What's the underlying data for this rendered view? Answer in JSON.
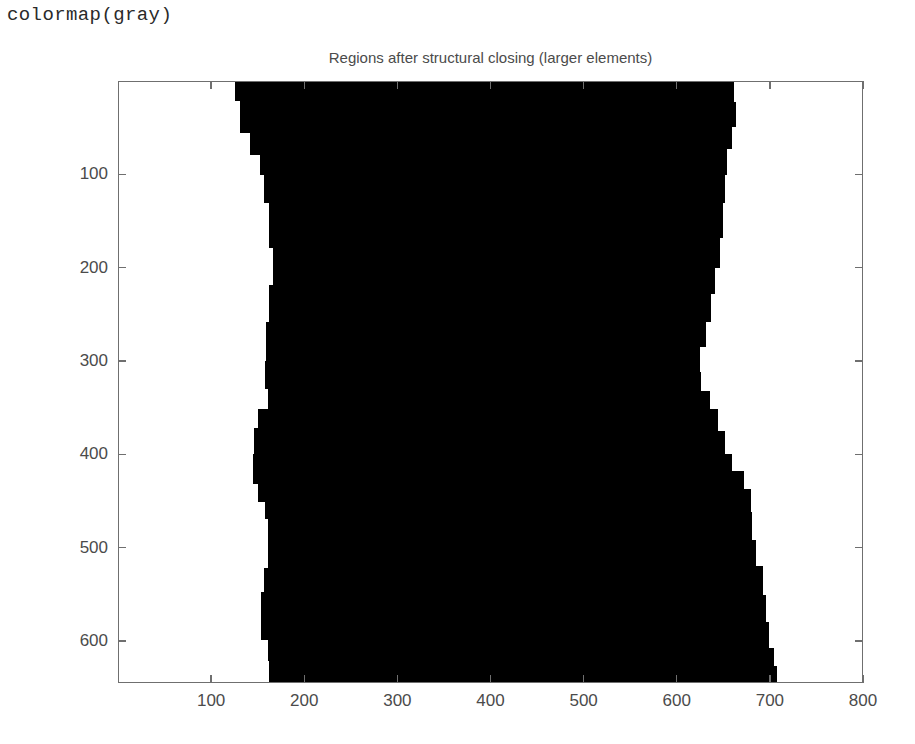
{
  "caption": {
    "code_text": "colormap(gray)"
  },
  "figure": {
    "title": "Regions after structural closing (larger elements)",
    "background_color": "#ffffff",
    "foreground_color": "#000000",
    "axis_color": "#6f6f6f",
    "text_color": "#4b4b4b",
    "xaxis": {
      "ticks": [
        100,
        200,
        300,
        400,
        500,
        600,
        700,
        800
      ],
      "ticklabels": [
        "100",
        "200",
        "300",
        "400",
        "500",
        "600",
        "700",
        "800"
      ],
      "range": [
        0,
        800
      ],
      "label": ""
    },
    "yaxis": {
      "ticks": [
        100,
        200,
        300,
        400,
        500,
        600
      ],
      "ticklabels": [
        "100",
        "200",
        "300",
        "400",
        "500",
        "600"
      ],
      "range": [
        0,
        645
      ],
      "label": ""
    }
  },
  "chart_data": {
    "type": "heatmap",
    "title": "Regions after structural closing (larger elements)",
    "xlabel": "",
    "ylabel": "",
    "colormap": "gray",
    "grid": false,
    "legend": "none",
    "xlim": [
      0,
      800
    ],
    "ylim": [
      645,
      0
    ],
    "value_levels": [
      0,
      1
    ],
    "level_colors": [
      "#000000",
      "#ffffff"
    ],
    "mask_region": {
      "name": "black-band",
      "value": 0,
      "left_edge_profile": [
        {
          "y": 0,
          "x": 125
        },
        {
          "y": 20,
          "x": 130
        },
        {
          "y": 55,
          "x": 141
        },
        {
          "y": 78,
          "x": 152
        },
        {
          "y": 100,
          "x": 156
        },
        {
          "y": 130,
          "x": 161
        },
        {
          "y": 178,
          "x": 166
        },
        {
          "y": 218,
          "x": 162
        },
        {
          "y": 258,
          "x": 158
        },
        {
          "y": 300,
          "x": 157
        },
        {
          "y": 330,
          "x": 160
        },
        {
          "y": 352,
          "x": 150
        },
        {
          "y": 372,
          "x": 145
        },
        {
          "y": 400,
          "x": 144
        },
        {
          "y": 432,
          "x": 150
        },
        {
          "y": 452,
          "x": 157
        },
        {
          "y": 470,
          "x": 160
        },
        {
          "y": 500,
          "x": 160
        },
        {
          "y": 522,
          "x": 156
        },
        {
          "y": 548,
          "x": 153
        },
        {
          "y": 575,
          "x": 153
        },
        {
          "y": 600,
          "x": 160
        },
        {
          "y": 622,
          "x": 161
        },
        {
          "y": 645,
          "x": 160
        }
      ],
      "right_edge_profile": [
        {
          "y": 0,
          "x": 655
        },
        {
          "y": 22,
          "x": 662
        },
        {
          "y": 48,
          "x": 664
        },
        {
          "y": 72,
          "x": 660
        },
        {
          "y": 100,
          "x": 655
        },
        {
          "y": 130,
          "x": 652
        },
        {
          "y": 168,
          "x": 650
        },
        {
          "y": 200,
          "x": 647
        },
        {
          "y": 228,
          "x": 642
        },
        {
          "y": 258,
          "x": 637
        },
        {
          "y": 285,
          "x": 632
        },
        {
          "y": 312,
          "x": 626
        },
        {
          "y": 332,
          "x": 627
        },
        {
          "y": 352,
          "x": 636
        },
        {
          "y": 375,
          "x": 645
        },
        {
          "y": 400,
          "x": 652
        },
        {
          "y": 418,
          "x": 660
        },
        {
          "y": 438,
          "x": 673
        },
        {
          "y": 462,
          "x": 680
        },
        {
          "y": 492,
          "x": 682
        },
        {
          "y": 520,
          "x": 686
        },
        {
          "y": 552,
          "x": 693
        },
        {
          "y": 580,
          "x": 697
        },
        {
          "y": 608,
          "x": 700
        },
        {
          "y": 628,
          "x": 705
        },
        {
          "y": 645,
          "x": 708
        }
      ]
    }
  }
}
